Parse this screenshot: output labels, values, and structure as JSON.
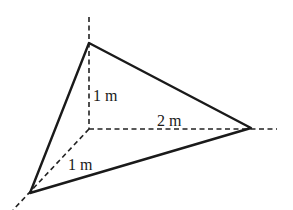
{
  "diagram": {
    "title": "",
    "type": "3d-tetrahedron-corner",
    "labels": {
      "vertical": "1 m",
      "horizontal": "2 m",
      "diagonal": "1 m"
    },
    "axes": [
      {
        "name": "z-axis",
        "direction": "vertical",
        "length_label": "1 m"
      },
      {
        "name": "x-axis",
        "direction": "horizontal",
        "length_label": "2 m"
      },
      {
        "name": "y-axis",
        "direction": "diagonal-down-left",
        "length_label": "1 m"
      }
    ],
    "vertices": [
      {
        "name": "origin",
        "x": 89,
        "y": 129
      },
      {
        "name": "top",
        "x": 89,
        "y": 43
      },
      {
        "name": "right",
        "x": 251,
        "y": 128
      },
      {
        "name": "bottom-left",
        "x": 30,
        "y": 193
      }
    ],
    "colors": {
      "line": "#1a1a1a",
      "background": "#ffffff"
    }
  }
}
